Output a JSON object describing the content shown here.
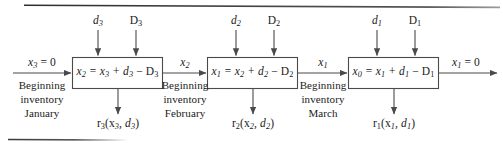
{
  "figure": {
    "type": "block-flow-diagram",
    "stages": [
      {
        "id": "stage-january",
        "box_equation": {
          "lhs": "x",
          "lhs_sub": "2",
          "text": "x₂ = x₃ + d₃ − D₃",
          "state_out": "x2",
          "state_in": "x3",
          "order": "d3",
          "demand": "D3"
        },
        "top_inputs": [
          {
            "label": "d",
            "sub": "3",
            "style": "italic",
            "name": "order-quantity"
          },
          {
            "label": "D",
            "sub": "3",
            "style": "roman",
            "name": "demand"
          }
        ],
        "input_arrow_label": "x₃ = 0",
        "input_caption": [
          "Beginning",
          "inventory",
          "January"
        ],
        "output_below": "r₃(x₃, d₃)"
      },
      {
        "id": "stage-february",
        "box_equation": {
          "lhs": "x",
          "lhs_sub": "1",
          "text": "x₁ = x₂ + d₂ − D₂",
          "state_out": "x1",
          "state_in": "x2",
          "order": "d2",
          "demand": "D2"
        },
        "top_inputs": [
          {
            "label": "d",
            "sub": "2",
            "style": "italic",
            "name": "order-quantity"
          },
          {
            "label": "D",
            "sub": "2",
            "style": "roman",
            "name": "demand"
          }
        ],
        "input_arrow_label": "x₂",
        "input_caption": [
          "Beginning",
          "inventory",
          "February"
        ],
        "output_below": "r₂(x₂, d₂)"
      },
      {
        "id": "stage-march",
        "box_equation": {
          "lhs": "x",
          "lhs_sub": "0",
          "text": "x₀ = x₁ + d₁ − D₁",
          "state_out": "x0",
          "state_in": "x1",
          "order": "d1",
          "demand": "D1"
        },
        "top_inputs": [
          {
            "label": "d",
            "sub": "1",
            "style": "italic",
            "name": "order-quantity"
          },
          {
            "label": "D",
            "sub": "1",
            "style": "roman",
            "name": "demand"
          }
        ],
        "input_arrow_label": "x₁",
        "input_caption": [
          "Beginning",
          "inventory",
          "March"
        ],
        "output_below": "r₁(x₁, d₁)"
      }
    ],
    "final_output_label": "x₁ = 0",
    "colors": {
      "line": "#4a4a4a",
      "text": "#1a1a1a",
      "rule": "#3b3b3b",
      "background": "#ffffff"
    }
  },
  "labels": {
    "rule_top": "",
    "rule_bottom": "",
    "box1_eq_a": "x",
    "box1_eq_sub_a": "2",
    "box1_eq_rest": " = x",
    "box1_eq_sub_b": "3",
    "box1_eq_rest2": " + d",
    "box1_eq_sub_c": "3",
    "box1_eq_rest3": " − D",
    "box1_eq_sub_d": "3",
    "box2_eq_a": "x",
    "box2_eq_sub_a": "1",
    "box2_eq_rest": " = x",
    "box2_eq_sub_b": "2",
    "box2_eq_rest2": " + d",
    "box2_eq_sub_c": "2",
    "box2_eq_rest3": " − D",
    "box2_eq_sub_d": "2",
    "box3_eq_a": "x",
    "box3_eq_sub_a": "0",
    "box3_eq_rest": " = x",
    "box3_eq_sub_b": "1",
    "box3_eq_rest2": " + d",
    "box3_eq_sub_c": "1",
    "box3_eq_rest3": " − D",
    "box3_eq_sub_d": "1",
    "d3": "d",
    "d3_sub": "3",
    "D3": "D",
    "D3_sub": "3",
    "d2": "d",
    "d2_sub": "2",
    "D2": "D",
    "D2_sub": "2",
    "d1": "d",
    "d1_sub": "1",
    "D1": "D",
    "D1_sub": "1",
    "in1_x": "x",
    "in1_sub": "3",
    "in1_eq": " = 0",
    "in2_x": "x",
    "in2_sub": "2",
    "in3_x": "x",
    "in3_sub": "1",
    "out_x": "x",
    "out_sub": "1",
    "out_eq": " = 0",
    "cap1_l1": "Beginning",
    "cap1_l2": "inventory",
    "cap1_l3": "January",
    "cap2_l1": "Beginning",
    "cap2_l2": "inventory",
    "cap2_l3": "February",
    "cap3_l1": "Beginning",
    "cap3_l2": "inventory",
    "cap3_l3": "March",
    "r3": "r",
    "r3_sub": "3",
    "r3_args_a": "(x",
    "r3_args_sub": "3",
    "r3_args_b": ", d",
    "r3_args_sub2": "3",
    "r3_args_c": ")",
    "r2": "r",
    "r2_sub": "2",
    "r2_args_a": "(x",
    "r2_args_sub": "2",
    "r2_args_b": ", d",
    "r2_args_sub2": "2",
    "r2_args_c": ")",
    "r1": "r",
    "r1_sub": "1",
    "r1_args_a": "(x",
    "r1_args_sub": "1",
    "r1_args_b": ", d",
    "r1_args_sub2": "1",
    "r1_args_c": ")"
  }
}
